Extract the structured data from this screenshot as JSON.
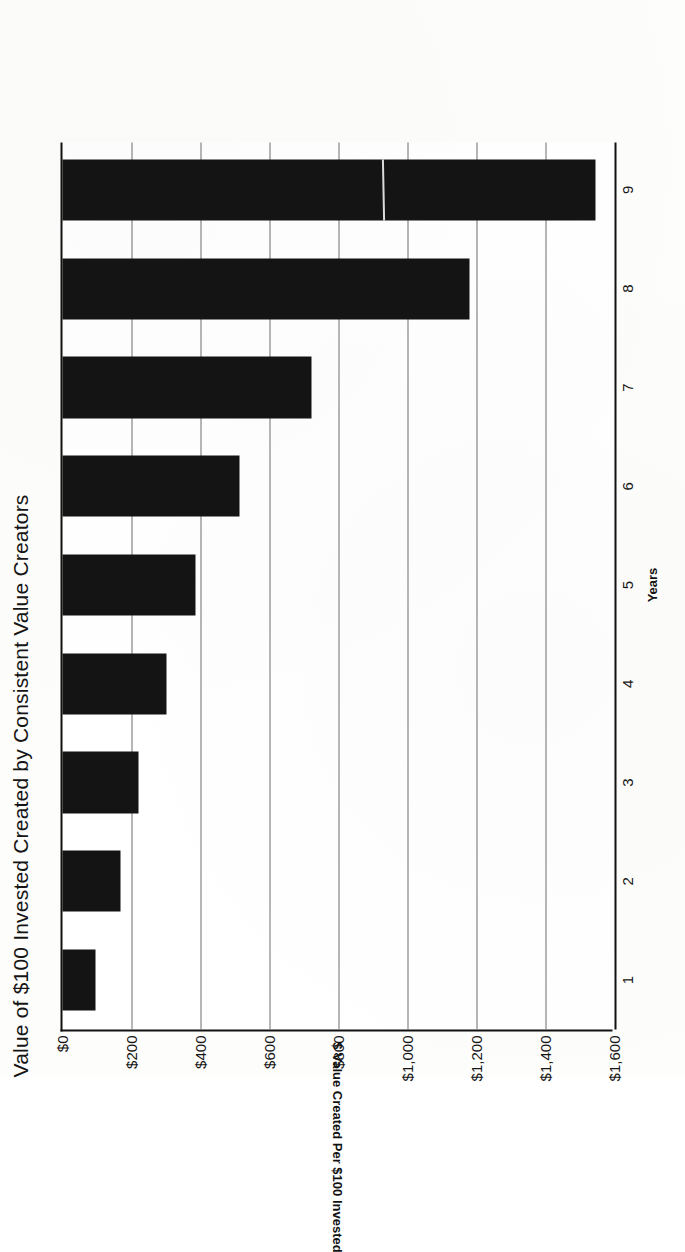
{
  "chart_data": {
    "type": "bar",
    "orientation": "vertical",
    "title": "Value of $100 Invested Created by Consistent Value Creators",
    "xlabel": "Years",
    "ylabel": "$ Value Created Per $100 Invested",
    "categories": [
      "1",
      "2",
      "3",
      "4",
      "5",
      "6",
      "7",
      "8",
      "9"
    ],
    "values": [
      96,
      168,
      220,
      300,
      385,
      513,
      722,
      1180,
      1545
    ],
    "ylim": [
      0,
      1600
    ],
    "ytick_values": [
      0,
      200,
      400,
      600,
      800,
      1000,
      1200,
      1400,
      1600
    ],
    "ytick_labels": [
      "$0",
      "$200",
      "$400",
      "$600",
      "$800",
      "$1,000",
      "$1,200",
      "$1,400",
      "$1,600"
    ],
    "grid": "value-axis-only",
    "legend": "none",
    "bar_color": "#141414",
    "gridline_color": "#6f6f6f",
    "axis_color": "#111111",
    "background_color": "#ffffff"
  },
  "page": {
    "rotation_note": "90-degrees-counter-clockwise",
    "value_axis_title_rotation_note": "180-degrees"
  }
}
